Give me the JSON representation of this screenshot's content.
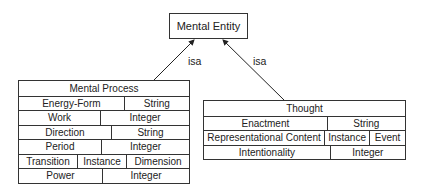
{
  "root": {
    "title": "Mental Entity"
  },
  "relations": [
    {
      "label": "isa"
    },
    {
      "label": "isa"
    }
  ],
  "mental_process": {
    "title": "Mental Process",
    "rows": [
      [
        {
          "text": "Energy-Form",
          "w": 106
        },
        {
          "text": "String",
          "w": 65
        }
      ],
      [
        {
          "text": "Work",
          "w": 82
        },
        {
          "text": "Integer",
          "w": 89
        }
      ],
      [
        {
          "text": "Direction",
          "w": 93
        },
        {
          "text": "String",
          "w": 78
        }
      ],
      [
        {
          "text": "Period",
          "w": 83
        },
        {
          "text": "Integer",
          "w": 88
        }
      ],
      [
        {
          "text": "Transition",
          "w": 59
        },
        {
          "text": "Instance",
          "w": 49
        },
        {
          "text": "Dimension",
          "w": 63
        }
      ],
      [
        {
          "text": "Power",
          "w": 84
        },
        {
          "text": "Integer",
          "w": 87
        }
      ]
    ]
  },
  "thought": {
    "title": "Thought",
    "rows": [
      [
        {
          "text": "Enactment",
          "w": 124
        },
        {
          "text": "String",
          "w": 78
        }
      ],
      [
        {
          "text": "Representational Content",
          "w": 134
        },
        {
          "text": "Instance",
          "w": 49
        },
        {
          "text": "Event",
          "w": 39
        }
      ],
      [
        {
          "text": "Intentionality",
          "w": 127
        },
        {
          "text": "Integer",
          "w": 75
        }
      ]
    ]
  }
}
